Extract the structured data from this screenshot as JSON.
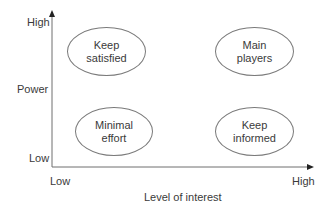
{
  "diagram": {
    "type": "stakeholder-power-interest-grid",
    "y_axis": {
      "label": "Power",
      "high_label": "High",
      "low_label": "Low"
    },
    "x_axis": {
      "label": "Level of interest",
      "low_label": "Low",
      "high_label": "High"
    },
    "quadrants": [
      {
        "id": "top-left",
        "line1": "Keep",
        "line2": "satisfied"
      },
      {
        "id": "top-right",
        "line1": "Main",
        "line2": "players"
      },
      {
        "id": "bottom-left",
        "line1": "Minimal",
        "line2": "effort"
      },
      {
        "id": "bottom-right",
        "line1": "Keep",
        "line2": "informed"
      }
    ],
    "colors": {
      "axis": "#6e6e6e",
      "ellipse_stroke": "#7a7a7a",
      "text": "#3a3a3a"
    }
  }
}
